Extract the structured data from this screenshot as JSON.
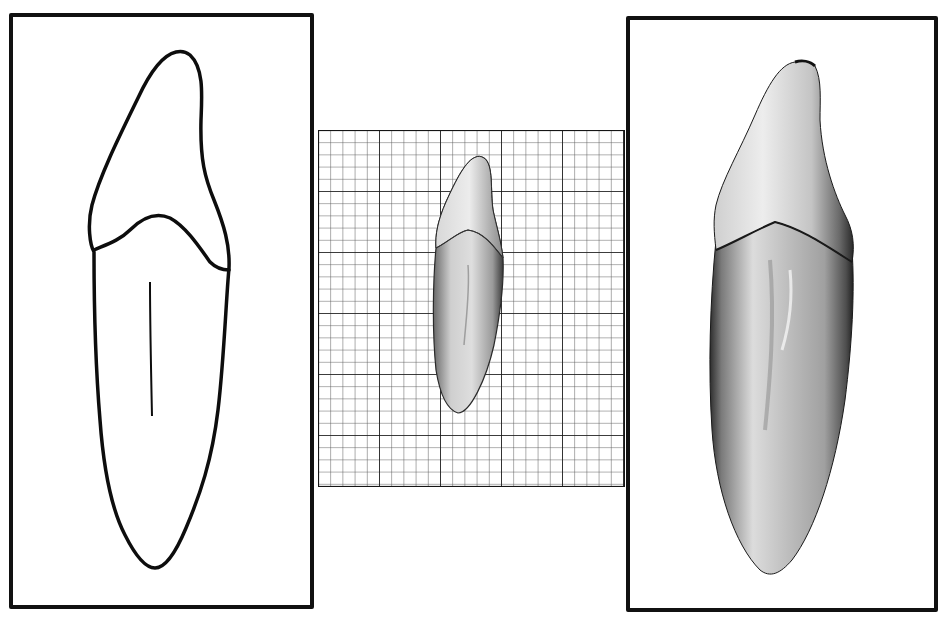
{
  "figure": {
    "panels": [
      {
        "id": "outline-drawing",
        "kind": "line-drawing",
        "subject": "tooth-outline"
      },
      {
        "id": "grid-photo",
        "kind": "photograph-on-graph-paper",
        "subject": "tooth"
      },
      {
        "id": "enlarged-photo",
        "kind": "photograph",
        "subject": "tooth-enlarged"
      }
    ],
    "grid": {
      "minor_cell_px": 12.2,
      "major_every": 5,
      "columns": 25,
      "rows": 29
    },
    "colors": {
      "background": "#ffffff",
      "border": "#111111",
      "grid_minor": "#555555",
      "grid_major": "#111111",
      "tooth_light": "#e6e6e6",
      "tooth_dark": "#4a4a4a"
    }
  }
}
